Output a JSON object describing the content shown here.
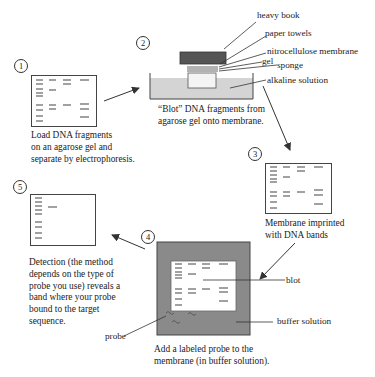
{
  "steps": [
    {
      "number": "1",
      "caption": [
        "Load DNA fragments",
        "on an agarose gel and",
        "separate by electrophoresis."
      ]
    },
    {
      "number": "2",
      "caption": [
        "“Blot” DNA fragments from",
        "agarose gel onto membrane."
      ]
    },
    {
      "number": "3",
      "caption": [
        "Membrane imprinted",
        "with DNA bands"
      ]
    },
    {
      "number": "4",
      "caption": [
        "Add a labeled probe to the",
        "membrane (in buffer solution)."
      ]
    },
    {
      "number": "5",
      "caption": [
        "Detection (the method",
        "depends on the type of",
        "probe you use) reveals a",
        "band where your probe",
        "bound to the target",
        "sequence."
      ]
    }
  ],
  "blot_setup_labels": {
    "heavy_book": "heavy book",
    "paper_towels": "paper towels",
    "membrane": "nitrocellulose membrane",
    "gel": "gel",
    "sponge": "sponge",
    "alkaline": "alkaline solution"
  },
  "step4_labels": {
    "blot": "blot",
    "buffer": "buffer solution",
    "probe": "probe"
  },
  "colors": {
    "book": "#555555",
    "solution": "#d4d4d4",
    "buffer_tray": "#8a8a8a",
    "line": "#333333"
  }
}
